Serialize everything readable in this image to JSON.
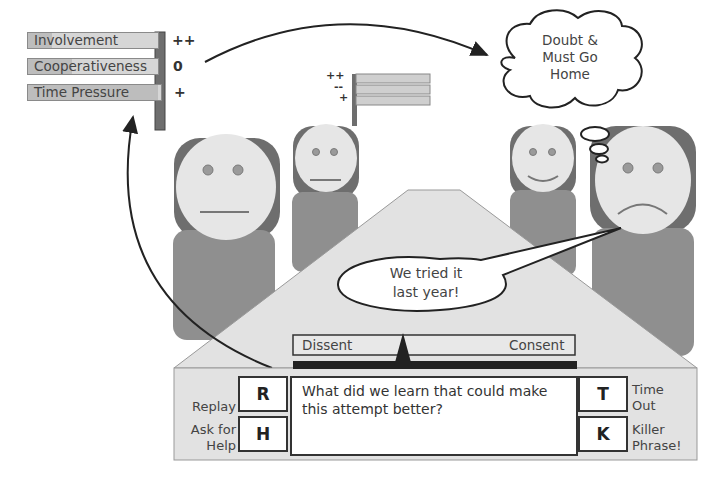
{
  "player_meter": {
    "rows": [
      {
        "label": "Involvement",
        "sign": "++"
      },
      {
        "label": "Cooperativeness",
        "sign": "0"
      },
      {
        "label": "Time Pressure",
        "sign": "+"
      }
    ]
  },
  "small_meter": {
    "signs": [
      "++",
      "--",
      "+"
    ]
  },
  "thought_bubble": {
    "lines": [
      "Doubt  &",
      "Must Go",
      "Home"
    ]
  },
  "speech_bubble": {
    "lines": [
      "We tried it",
      "last year!"
    ]
  },
  "consensus_scale": {
    "left_label": "Dissent",
    "right_label": "Consent"
  },
  "controls": {
    "prompt_line1": "What did we learn that could make",
    "prompt_line2": "this attempt better?",
    "keys": [
      {
        "key": "R",
        "label_lines": [
          "Replay"
        ]
      },
      {
        "key": "H",
        "label_lines": [
          "Ask for",
          "Help"
        ]
      },
      {
        "key": "T",
        "label_lines": [
          "Time",
          "Out"
        ]
      },
      {
        "key": "K",
        "label_lines": [
          "Killer",
          "Phrase!"
        ]
      }
    ]
  },
  "colors": {
    "hair": "#6e6e6e",
    "face": "#e6e6e6",
    "body": "#8f8f8f",
    "table": "#e2e2e2",
    "outline": "#222222"
  }
}
